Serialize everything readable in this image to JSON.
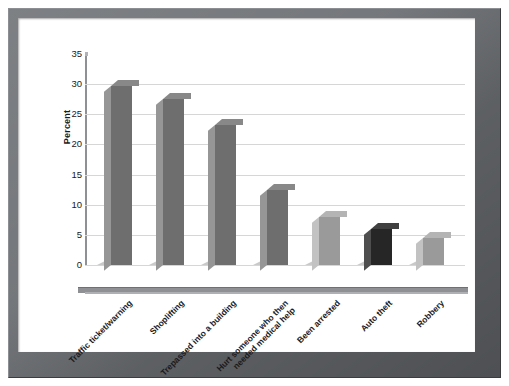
{
  "figure": {
    "frame_color": "#6f7276",
    "background_color": "#ffffff"
  },
  "chart_data": {
    "type": "bar",
    "title": "",
    "subtitle": "",
    "xlabel": "",
    "ylabel": "Percent",
    "ylim": [
      0,
      35
    ],
    "yticks": [
      0,
      5,
      10,
      15,
      20,
      25,
      30,
      35
    ],
    "ytick_labels": [
      "0",
      "5",
      "10",
      "15",
      "20",
      "25",
      "30",
      "35"
    ],
    "grid": true,
    "grid_axis": "y",
    "legend": false,
    "legend_position": "none",
    "three_d": true,
    "categories": [
      "Traffic ticket/warning",
      "Shoplifting",
      "Trepassed into a building",
      "Hurt someone who then\nneeded medical help",
      "Been arrested",
      "Auto theft",
      "Robbery"
    ],
    "values": [
      29.7,
      27.5,
      23.3,
      12.4,
      8.0,
      6.0,
      4.5
    ],
    "bar_colors": [
      "#6e6e6e",
      "#6e6e6e",
      "#6e6e6e",
      "#6e6e6e",
      "#9a9a9a",
      "#262626",
      "#9a9a9a"
    ]
  },
  "axis": {
    "y_title": "Percent"
  }
}
